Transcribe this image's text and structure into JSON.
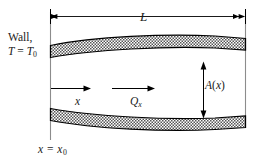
{
  "figure": {
    "name": "variable-area-duct-heat-conduction-diagram",
    "background_color": "#ffffff",
    "line_color": "#000000",
    "reference_line_color": "#8c8c8c",
    "hatch_color": "#4d4d4d"
  },
  "labels": {
    "length": "L",
    "wall_line1": "Wall,",
    "wall_symbol_T": "T",
    "wall_equals": " = ",
    "wall_symbol_T0": "T",
    "wall_sub_0": "0",
    "axis_x": "x",
    "heat_flow_Q": "Q",
    "heat_flow_sub_x": "x",
    "area_A": "A",
    "area_arg_open": "(",
    "area_arg_x": "x",
    "area_arg_close": ")",
    "origin_x": "x",
    "origin_equals": " = ",
    "origin_x0": "x",
    "origin_sub_0": "0"
  },
  "annotations": {
    "length_arrow": "double-headed-horizontal-arrow",
    "area_arrow": "double-headed-vertical-arrow",
    "x_arrow": "right-arrow",
    "heat_arrow": "right-arrow",
    "origin_marker": "vertical-reference-line"
  }
}
